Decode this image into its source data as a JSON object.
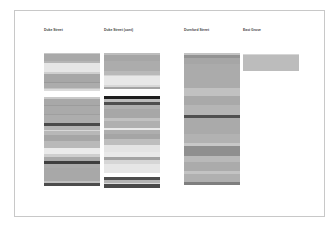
{
  "columns": [
    {
      "title": "Duke Street",
      "x": 44,
      "blocks": [
        {
          "top": 53,
          "bands": [
            {
              "h": 1,
              "c": "#c8c8c8"
            },
            {
              "h": 7,
              "c": "#a9a9a9"
            },
            {
              "h": 2,
              "c": "#b5b5b5"
            },
            {
              "h": 9,
              "c": "#e6e6e6"
            },
            {
              "h": 2,
              "c": "#cfcfcf"
            },
            {
              "h": 8,
              "c": "#a7a7a7"
            },
            {
              "h": 1,
              "c": "#9a9a9a"
            },
            {
              "h": 5,
              "c": "#acacac"
            },
            {
              "h": 1,
              "c": "#c4c4c4"
            },
            {
              "h": 2,
              "c": "#dcdcdc"
            }
          ]
        },
        {
          "top": 97,
          "bands": [
            {
              "h": 2,
              "c": "#c9c9c9"
            },
            {
              "h": 6,
              "c": "#a8a8a8"
            },
            {
              "h": 1,
              "c": "#9c9c9c"
            },
            {
              "h": 8,
              "c": "#aaaaaa"
            },
            {
              "h": 1,
              "c": "#9f9f9f"
            },
            {
              "h": 8,
              "c": "#adadad"
            },
            {
              "h": 3,
              "c": "#4a4a4a"
            },
            {
              "h": 4,
              "c": "#b4b4b4"
            },
            {
              "h": 1,
              "c": "#d8d8d8"
            },
            {
              "h": 4,
              "c": "#b8b8b8"
            },
            {
              "h": 6,
              "c": "#a6a6a6"
            },
            {
              "h": 7,
              "c": "#b9b9b9"
            },
            {
              "h": 6,
              "c": "#ebebeb"
            },
            {
              "h": 3,
              "c": "#cfcfcf"
            },
            {
              "h": 4,
              "c": "#a9a9a9"
            },
            {
              "h": 3,
              "c": "#3f3f3f"
            },
            {
              "h": 4,
              "c": "#ababab"
            },
            {
              "h": 13,
              "c": "#a8a8a8"
            },
            {
              "h": 2,
              "c": "#c0c0c0"
            },
            {
              "h": 3,
              "c": "#4c4c4c"
            }
          ]
        }
      ]
    },
    {
      "title": "Duke Street (cont)",
      "x": 104,
      "blocks": [
        {
          "top": 53,
          "bands": [
            {
              "h": 2,
              "c": "#bdbdbd"
            },
            {
              "h": 6,
              "c": "#a6a6a6"
            },
            {
              "h": 10,
              "c": "#acacac"
            },
            {
              "h": 4,
              "c": "#b9b9b9"
            },
            {
              "h": 1,
              "c": "#d3d3d3"
            },
            {
              "h": 9,
              "c": "#e8e8e8"
            },
            {
              "h": 2,
              "c": "#d8d8d8"
            },
            {
              "h": 2,
              "c": "#a4a4a4"
            }
          ]
        },
        {
          "top": 96,
          "bands": [
            {
              "h": 3,
              "c": "#1e1e1e"
            },
            {
              "h": 3,
              "c": "#bdbdbd"
            },
            {
              "h": 3,
              "c": "#4f4f4f"
            },
            {
              "h": 4,
              "c": "#b0b0b0"
            },
            {
              "h": 9,
              "c": "#a7a7a7"
            },
            {
              "h": 3,
              "c": "#c1c1c1"
            },
            {
              "h": 7,
              "c": "#b0b0b0"
            },
            {
              "h": 2,
              "c": "#e9e9e9"
            },
            {
              "h": 4,
              "c": "#aeaeae"
            },
            {
              "h": 5,
              "c": "#a5a5a5"
            },
            {
              "h": 6,
              "c": "#bebebe"
            },
            {
              "h": 7,
              "c": "#e4e4e4"
            },
            {
              "h": 5,
              "c": "#e9e9e9"
            },
            {
              "h": 3,
              "c": "#a3a3a3"
            },
            {
              "h": 4,
              "c": "#d6d6d6"
            },
            {
              "h": 9,
              "c": "#e6e6e6"
            }
          ]
        },
        {
          "top": 177,
          "bands": [
            {
              "h": 3,
              "c": "#4d4d4d"
            },
            {
              "h": 3,
              "c": "#b4b4b4"
            },
            {
              "h": 1,
              "c": "#dcdcdc"
            },
            {
              "h": 4,
              "c": "#4a4a4a"
            }
          ]
        }
      ]
    },
    {
      "title": "Durnford Street",
      "x": 184,
      "blocks": [
        {
          "top": 53,
          "bands": [
            {
              "h": 2,
              "c": "#c4c4c4"
            },
            {
              "h": 3,
              "c": "#939393"
            },
            {
              "h": 6,
              "c": "#a6a6a6"
            },
            {
              "h": 24,
              "c": "#ababab"
            },
            {
              "h": 8,
              "c": "#c1c1c1"
            },
            {
              "h": 9,
              "c": "#a9a9a9"
            },
            {
              "h": 10,
              "c": "#b5b5b5"
            },
            {
              "h": 3,
              "c": "#505050"
            },
            {
              "h": 16,
              "c": "#aaaaaa"
            },
            {
              "h": 9,
              "c": "#b2b2b2"
            },
            {
              "h": 3,
              "c": "#c8c8c8"
            },
            {
              "h": 10,
              "c": "#8f8f8f"
            },
            {
              "h": 6,
              "c": "#b9b9b9"
            },
            {
              "h": 9,
              "c": "#ababab"
            },
            {
              "h": 3,
              "c": "#c3c3c3"
            },
            {
              "h": 8,
              "c": "#b0b0b0"
            },
            {
              "h": 3,
              "c": "#7f7f7f"
            }
          ]
        }
      ]
    },
    {
      "title": "East Grove",
      "x": 243,
      "blocks": [
        {
          "top": 54,
          "bands": [
            {
              "h": 1,
              "c": "#d6d6d6"
            },
            {
              "h": 16,
              "c": "#bcbcbc"
            }
          ]
        }
      ]
    }
  ]
}
